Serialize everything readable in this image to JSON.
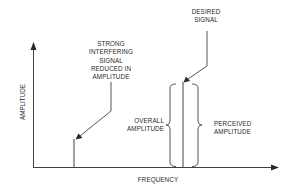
{
  "diagram": {
    "axes": {
      "x_label": "FREQUENCY",
      "y_label": "AMPLITUDE"
    },
    "annotations": {
      "interferer": [
        "STRONG",
        "INTERFERING",
        "SIGNAL",
        "REDUCED IN",
        "AMPLITUDE"
      ],
      "desired": [
        "DESIRED",
        "SIGNAL"
      ],
      "overall": [
        "OVERALL",
        "AMPLITUDE"
      ],
      "perceived": [
        "PERCEIVED",
        "AMPLITUDE"
      ]
    },
    "signals": [
      {
        "name": "interfering-signal",
        "x": 74,
        "top": 139
      },
      {
        "name": "desired-signal",
        "x": 183,
        "top": 82
      }
    ],
    "colors": {
      "line": "#2a2a2a",
      "background": "#ffffff"
    }
  }
}
